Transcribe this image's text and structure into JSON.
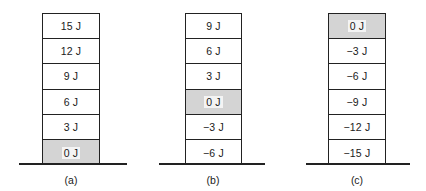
{
  "figure": {
    "panels": [
      {
        "caption": "(a)",
        "reference_level": "0 J",
        "levels": [
          "15 J",
          "12 J",
          "9 J",
          "6 J",
          "3 J",
          "0 J"
        ],
        "shaded_index": 5
      },
      {
        "caption": "(b)",
        "reference_level": "0 J",
        "levels": [
          "9 J",
          "6 J",
          "3 J",
          "0 J",
          "−3 J",
          "−6 J"
        ],
        "shaded_index": 3
      },
      {
        "caption": "(c)",
        "reference_level": "0 J",
        "levels": [
          "0 J",
          "−3 J",
          "−6 J",
          "−9 J",
          "−12 J",
          "−15 J"
        ],
        "shaded_index": 0
      }
    ],
    "colors": {
      "line": "#222222",
      "shaded_fill": "#d4d4d4",
      "background": "#ffffff"
    }
  }
}
